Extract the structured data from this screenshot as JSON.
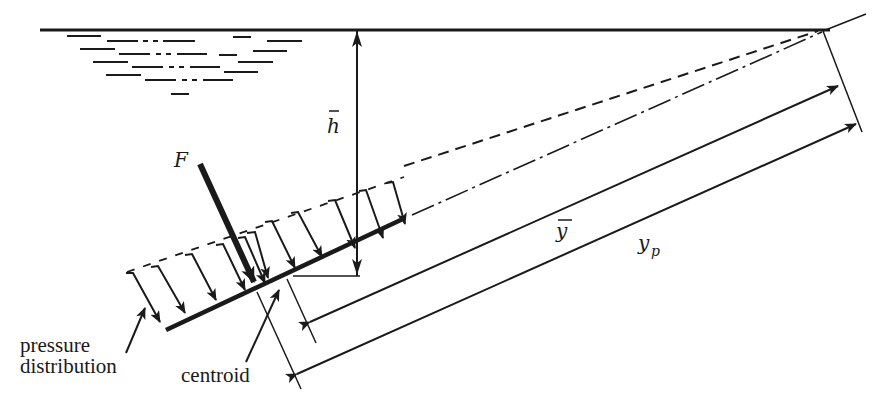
{
  "diagram": {
    "labels": {
      "force": "F",
      "depth_centroid": "h",
      "distance_centroid": "y",
      "distance_pressure_center": "y",
      "distance_pressure_center_subscript": "p",
      "pressure_distribution_line1": "pressure",
      "pressure_distribution_line2": "distribution",
      "centroid": "centroid"
    },
    "elements": {
      "free_surface": "water free surface",
      "water_hatching": "dash and dash-dot wave lines",
      "plate": "inclined plane surface (bold)",
      "pressure_arrows_count": 11,
      "extension_dashed": "dashed pressure envelope extension",
      "extension_dashdot": "dash-dot centerline extension to surface"
    },
    "colors": {
      "ink": "#1a1a1a",
      "background": "#ffffff"
    }
  }
}
